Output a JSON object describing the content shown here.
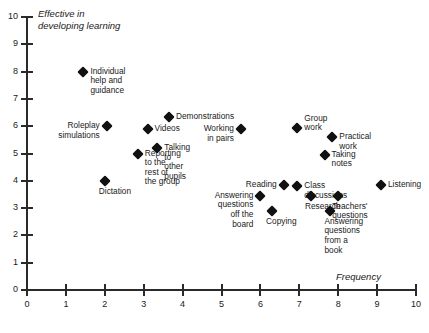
{
  "chart_data": {
    "type": "scatter",
    "title": "",
    "xlabel": "Frequency",
    "ylabel": "Effective in\ndeveloping learning",
    "xlim": [
      0,
      10
    ],
    "ylim": [
      0,
      10
    ],
    "xticks": [
      "0",
      "1",
      "2",
      "3",
      "4",
      "5",
      "6",
      "7",
      "8",
      "9",
      "10"
    ],
    "yticks": [
      "0",
      "1",
      "2",
      "3",
      "4",
      "5",
      "6",
      "7",
      "8",
      "9",
      "10"
    ],
    "grid": false,
    "legend": "none",
    "marker": "diamond",
    "marker_color": "#111111",
    "points": [
      {
        "label": "Individual help and guidance",
        "x": 1.45,
        "y": 8.0,
        "label_pos": "right"
      },
      {
        "label": "Roleplay simulations",
        "x": 2.05,
        "y": 6.0,
        "label_pos": "left"
      },
      {
        "label": "Demonstrations",
        "x": 3.65,
        "y": 6.35,
        "label_pos": "right"
      },
      {
        "label": "Videos",
        "x": 3.1,
        "y": 5.9,
        "label_pos": "right"
      },
      {
        "label": "Working in pairs",
        "x": 5.5,
        "y": 5.9,
        "label_pos": "left"
      },
      {
        "label": "Talking to other pupils",
        "x": 3.35,
        "y": 5.2,
        "label_pos": "right"
      },
      {
        "label": "Reporting to the rest of the group",
        "x": 2.85,
        "y": 5.0,
        "label_pos": "right"
      },
      {
        "label": "Group work",
        "x": 6.95,
        "y": 5.95,
        "label_pos": "above"
      },
      {
        "label": "Practical work",
        "x": 7.85,
        "y": 5.6,
        "label_pos": "right"
      },
      {
        "label": "Taking notes",
        "x": 7.65,
        "y": 4.95,
        "label_pos": "right"
      },
      {
        "label": "Dictation",
        "x": 2.0,
        "y": 4.0,
        "label_pos": "below"
      },
      {
        "label": "Reading",
        "x": 6.6,
        "y": 3.85,
        "label_pos": "left"
      },
      {
        "label": "Class discussions",
        "x": 6.95,
        "y": 3.8,
        "label_pos": "right"
      },
      {
        "label": "Listening",
        "x": 9.1,
        "y": 3.85,
        "label_pos": "right"
      },
      {
        "label": "Answering questions\noff the board",
        "x": 6.0,
        "y": 3.45,
        "label_pos": "left"
      },
      {
        "label": "Research",
        "x": 7.3,
        "y": 3.45,
        "label_pos": "below"
      },
      {
        "label": "Teachers' questions",
        "x": 8.0,
        "y": 3.45,
        "label_pos": "below"
      },
      {
        "label": "Copying",
        "x": 6.3,
        "y": 2.9,
        "label_pos": "below"
      },
      {
        "label": "Answering questions\nfrom a book",
        "x": 7.8,
        "y": 2.9,
        "label_pos": "below"
      }
    ]
  }
}
